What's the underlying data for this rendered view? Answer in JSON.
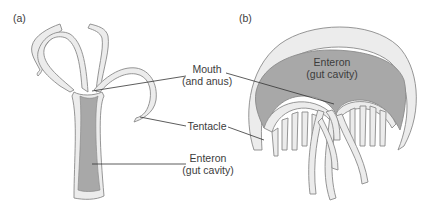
{
  "figure": {
    "panels": [
      {
        "id": "a",
        "label": "(a)",
        "organism_form": "polyp"
      },
      {
        "id": "b",
        "label": "(b)",
        "organism_form": "medusa"
      }
    ],
    "labels": {
      "mouth": {
        "line1": "Mouth",
        "line2": "(and anus)"
      },
      "tentacle": {
        "line1": "Tentacle"
      },
      "enteron_a": {
        "line1": "Enteron",
        "line2": "(gut cavity)"
      },
      "enteron_b": {
        "line1": "Enteron",
        "line2": "(gut cavity)"
      }
    },
    "colors": {
      "body_fill": "#ececec",
      "gut_fill": "#a8a8a8",
      "outline": "#8a8a8a",
      "leader_line": "#333333",
      "text": "#3c3c3c"
    }
  }
}
